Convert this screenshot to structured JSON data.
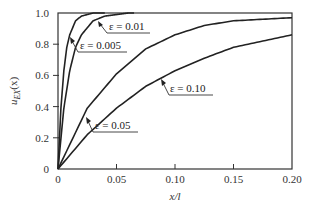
{
  "chart_data": {
    "type": "line",
    "title": "",
    "xlabel": "x/l",
    "ylabel": "u_EX(x)",
    "xlim": [
      0,
      0.2
    ],
    "ylim": [
      0,
      1.0
    ],
    "grid": false,
    "legend": "none (curves labeled with arrow annotations)",
    "x_ticks": [
      0,
      0.05,
      0.1,
      0.15,
      0.2
    ],
    "x_tick_labels": [
      "0",
      "0.05",
      "0.10",
      "0.15",
      "0.20"
    ],
    "y_ticks": [
      0,
      0.2,
      0.4,
      0.6,
      0.8,
      1.0
    ],
    "y_tick_labels": [
      "0",
      "0.2",
      "0.4",
      "0.6",
      "0.8",
      "1.0"
    ],
    "series": [
      {
        "name": "ε = 0.005",
        "epsilon": 0.005,
        "x": [
          0,
          0.0025,
          0.005,
          0.0075,
          0.01,
          0.015,
          0.02,
          0.025,
          0.03,
          0.035,
          0.04
        ],
        "values": [
          0,
          0.39,
          0.63,
          0.78,
          0.86,
          0.95,
          0.98,
          0.99,
          1.0,
          1.0,
          1.0
        ]
      },
      {
        "name": "ε = 0.01",
        "epsilon": 0.01,
        "x": [
          0,
          0.005,
          0.01,
          0.015,
          0.02,
          0.03,
          0.04,
          0.05,
          0.06,
          0.065
        ],
        "values": [
          0,
          0.39,
          0.63,
          0.78,
          0.86,
          0.95,
          0.98,
          0.99,
          1.0,
          1.0
        ]
      },
      {
        "name": "ε = 0.05",
        "epsilon": 0.05,
        "x": [
          0,
          0.025,
          0.05,
          0.075,
          0.1,
          0.125,
          0.15,
          0.175,
          0.2
        ],
        "values": [
          0,
          0.39,
          0.61,
          0.77,
          0.86,
          0.92,
          0.95,
          0.96,
          0.97
        ]
      },
      {
        "name": "ε = 0.10",
        "epsilon": 0.1,
        "x": [
          0,
          0.025,
          0.05,
          0.075,
          0.1,
          0.125,
          0.15,
          0.175,
          0.2
        ],
        "values": [
          0,
          0.22,
          0.39,
          0.53,
          0.63,
          0.71,
          0.78,
          0.82,
          0.86
        ]
      }
    ],
    "annotations": [
      {
        "text": "ε = 0.01",
        "points_to_series": "ε = 0.01"
      },
      {
        "text": "ε = 0.005",
        "points_to_series": "ε = 0.005"
      },
      {
        "text": "ε = 0.10",
        "points_to_series": "ε = 0.10"
      },
      {
        "text": "ε = 0.05",
        "points_to_series": "ε = 0.05"
      }
    ]
  },
  "labels": {
    "xlabel": "x/l",
    "ylabel_main": "u",
    "ylabel_sub": "EX",
    "ylabel_arg": "(x)",
    "ann_001": "ε = 0.01",
    "ann_0005": "ε = 0.005",
    "ann_010": "ε = 0.10",
    "ann_005": "ε = 0.05"
  }
}
